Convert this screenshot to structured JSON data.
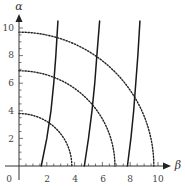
{
  "chart_data": {
    "type": "line",
    "title": "",
    "xlabel": "β",
    "ylabel": "α",
    "xlim": [
      0,
      10.8
    ],
    "ylim": [
      0,
      10.6
    ],
    "grid": false,
    "legend": null,
    "x_ticks": [
      2,
      4,
      6,
      8,
      10
    ],
    "y_ticks": [
      2,
      4,
      6,
      8,
      10
    ],
    "origin_label": "0",
    "series": [
      {
        "name": "dotted-arc-r3.8",
        "style": "dotted",
        "shape": "quarter-circle",
        "radius": 3.8
      },
      {
        "name": "dotted-arc-r6.9",
        "style": "dotted",
        "shape": "quarter-circle",
        "radius": 6.9
      },
      {
        "name": "dotted-arc-r9.7",
        "style": "dotted",
        "shape": "quarter-circle",
        "radius": 9.7
      },
      {
        "name": "solid-curve-1",
        "style": "solid",
        "points": [
          [
            1.6,
            0
          ],
          [
            2.0,
            2
          ],
          [
            2.3,
            4
          ],
          [
            2.5,
            6
          ],
          [
            2.65,
            8
          ],
          [
            2.8,
            10.5
          ]
        ]
      },
      {
        "name": "solid-curve-2",
        "style": "solid",
        "points": [
          [
            4.7,
            0
          ],
          [
            5.0,
            2
          ],
          [
            5.25,
            4
          ],
          [
            5.45,
            6
          ],
          [
            5.6,
            8
          ],
          [
            5.8,
            10.5
          ]
        ]
      },
      {
        "name": "solid-curve-3",
        "style": "solid",
        "points": [
          [
            7.8,
            0
          ],
          [
            8.05,
            2
          ],
          [
            8.25,
            4
          ],
          [
            8.4,
            6
          ],
          [
            8.55,
            8
          ],
          [
            8.7,
            10.5
          ]
        ]
      }
    ]
  },
  "axes": {
    "x_label": "β",
    "y_label": "α",
    "origin": "0",
    "x_tick_labels": [
      "2",
      "4",
      "6",
      "8",
      "10"
    ],
    "y_tick_labels": [
      "2",
      "4",
      "6",
      "8",
      "10"
    ]
  }
}
